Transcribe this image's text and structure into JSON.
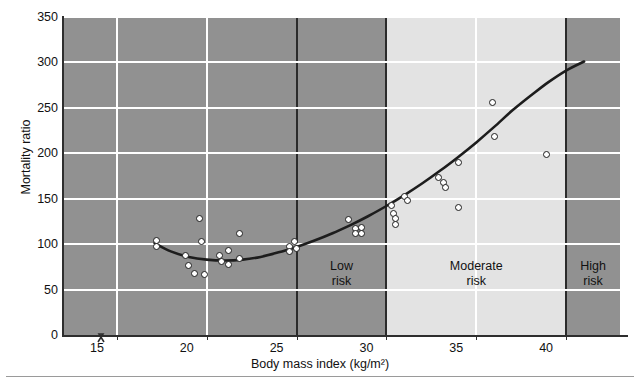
{
  "chart_data": {
    "type": "scatter",
    "title": "",
    "xlabel": "Body mass index (kg/m2)",
    "xlabel_display": "Body mass index (kg/m²)",
    "ylabel": "Mortality ratio",
    "xlim": [
      12,
      43
    ],
    "ylim": [
      0,
      350
    ],
    "xticks": [
      15,
      20,
      25,
      30,
      35,
      40
    ],
    "yticks": [
      0,
      50,
      100,
      150,
      200,
      250,
      300,
      350
    ],
    "grid": true,
    "legend": "none",
    "axis_break": true,
    "points": [
      {
        "x": 17.2,
        "y": 104
      },
      {
        "x": 17.2,
        "y": 97
      },
      {
        "x": 18.8,
        "y": 88
      },
      {
        "x": 19.0,
        "y": 77
      },
      {
        "x": 19.3,
        "y": 68
      },
      {
        "x": 19.9,
        "y": 67
      },
      {
        "x": 19.6,
        "y": 128
      },
      {
        "x": 19.7,
        "y": 103
      },
      {
        "x": 20.7,
        "y": 88
      },
      {
        "x": 20.8,
        "y": 81
      },
      {
        "x": 21.2,
        "y": 93
      },
      {
        "x": 21.2,
        "y": 78
      },
      {
        "x": 21.8,
        "y": 84
      },
      {
        "x": 21.8,
        "y": 112
      },
      {
        "x": 24.6,
        "y": 97
      },
      {
        "x": 24.6,
        "y": 92
      },
      {
        "x": 24.9,
        "y": 103
      },
      {
        "x": 25.0,
        "y": 95
      },
      {
        "x": 27.9,
        "y": 127
      },
      {
        "x": 28.3,
        "y": 117
      },
      {
        "x": 28.3,
        "y": 112
      },
      {
        "x": 28.6,
        "y": 118
      },
      {
        "x": 28.6,
        "y": 112
      },
      {
        "x": 30.3,
        "y": 143
      },
      {
        "x": 30.4,
        "y": 134
      },
      {
        "x": 30.5,
        "y": 128
      },
      {
        "x": 30.5,
        "y": 122
      },
      {
        "x": 31.0,
        "y": 152
      },
      {
        "x": 31.2,
        "y": 148
      },
      {
        "x": 32.9,
        "y": 173
      },
      {
        "x": 33.2,
        "y": 168
      },
      {
        "x": 33.3,
        "y": 162
      },
      {
        "x": 34.0,
        "y": 140
      },
      {
        "x": 34.0,
        "y": 190
      },
      {
        "x": 35.9,
        "y": 256
      },
      {
        "x": 36.0,
        "y": 218
      },
      {
        "x": 38.9,
        "y": 199
      }
    ],
    "fit_curve": {
      "label": "fitted mortality curve",
      "points": [
        {
          "x": 17.1,
          "y": 101
        },
        {
          "x": 18.0,
          "y": 92
        },
        {
          "x": 19.0,
          "y": 86
        },
        {
          "x": 20.0,
          "y": 83
        },
        {
          "x": 21.0,
          "y": 82
        },
        {
          "x": 22.0,
          "y": 83
        },
        {
          "x": 23.0,
          "y": 86
        },
        {
          "x": 24.0,
          "y": 91
        },
        {
          "x": 25.0,
          "y": 97
        },
        {
          "x": 26.0,
          "y": 104
        },
        {
          "x": 27.0,
          "y": 112
        },
        {
          "x": 28.0,
          "y": 121
        },
        {
          "x": 29.0,
          "y": 131
        },
        {
          "x": 30.0,
          "y": 142
        },
        {
          "x": 31.0,
          "y": 154
        },
        {
          "x": 32.0,
          "y": 167
        },
        {
          "x": 33.0,
          "y": 181
        },
        {
          "x": 34.0,
          "y": 196
        },
        {
          "x": 35.0,
          "y": 212
        },
        {
          "x": 36.0,
          "y": 229
        },
        {
          "x": 37.0,
          "y": 247
        },
        {
          "x": 38.0,
          "y": 263
        },
        {
          "x": 39.0,
          "y": 278
        },
        {
          "x": 40.0,
          "y": 291
        },
        {
          "x": 41.0,
          "y": 301
        }
      ]
    },
    "zones": [
      {
        "name": "low-risk",
        "label_line1": "Low",
        "label_line2": "risk",
        "x_start": 25,
        "x_end": 30,
        "shade": "dark"
      },
      {
        "name": "moderate-risk",
        "label_line1": "Moderate",
        "label_line2": "risk",
        "x_start": 30,
        "x_end": 40,
        "shade": "light"
      },
      {
        "name": "high-risk",
        "label_line1": "High",
        "label_line2": "risk",
        "x_start": 40,
        "x_end": 43,
        "shade": "dark"
      }
    ],
    "colors": {
      "plot_background_dark": "#919191",
      "plot_background_light": "#e3e3e3",
      "gridline": "#ffffff",
      "curve": "#1d1d1d",
      "point_fill": "#ffffff",
      "point_stroke": "#1d1d1d",
      "axis": "#2e2e2e",
      "text": "#111111"
    }
  },
  "axes": {
    "y_title": "Mortality ratio",
    "x_title": "Body mass index (kg/m²)",
    "y_tick_labels": [
      "350",
      "300",
      "250",
      "200",
      "150",
      "100",
      "50",
      "0"
    ],
    "x_tick_labels": [
      "15",
      "20",
      "25",
      "30",
      "35",
      "40"
    ]
  }
}
